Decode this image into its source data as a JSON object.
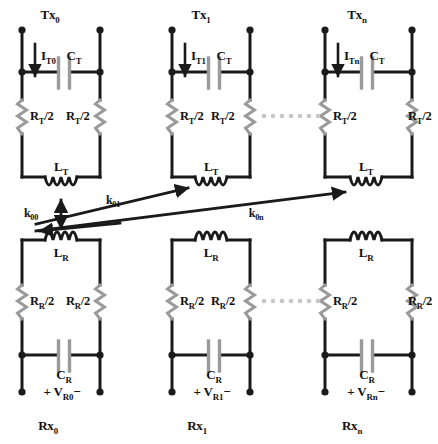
{
  "figure": {
    "type": "circuit-schematic",
    "background_color": "#ffffff",
    "line_color": "#1a1a1a",
    "component_color": "#9a9a9a",
    "dots_color": "#bdbdbd"
  },
  "transmitters": [
    {
      "id": "tx0",
      "title": "Tx",
      "title_sub": "0",
      "current_label": "I",
      "current_sub": "T0",
      "capacitor": "C",
      "capacitor_sub": "T",
      "resistor_left": "R",
      "resistor_left_sub": "T",
      "resistor_left_suffix": "/2",
      "resistor_right": "R",
      "resistor_right_sub": "T",
      "resistor_right_suffix": "/2",
      "inductor": "L",
      "inductor_sub": "T"
    },
    {
      "id": "tx1",
      "title": "Tx",
      "title_sub": "1",
      "current_label": "I",
      "current_sub": "T1",
      "capacitor": "C",
      "capacitor_sub": "T",
      "resistor_left": "R",
      "resistor_left_sub": "T",
      "resistor_left_suffix": "/2",
      "resistor_right": "R",
      "resistor_right_sub": "T",
      "resistor_right_suffix": "/2",
      "inductor": "L",
      "inductor_sub": "T"
    },
    {
      "id": "txn",
      "title": "Tx",
      "title_sub": "n",
      "current_label": "I",
      "current_sub": "Tn",
      "capacitor": "C",
      "capacitor_sub": "T",
      "resistor_left": "R",
      "resistor_left_sub": "T",
      "resistor_left_suffix": "/2",
      "resistor_right": "R",
      "resistor_right_sub": "T",
      "resistor_right_suffix": "/2",
      "inductor": "L",
      "inductor_sub": "T"
    }
  ],
  "receivers": [
    {
      "id": "rx0",
      "title": "Rx",
      "title_sub": "0",
      "inductor": "L",
      "inductor_sub": "R",
      "resistor_left": "R",
      "resistor_left_sub": "R",
      "resistor_left_suffix": "/2",
      "resistor_right": "R",
      "resistor_right_sub": "R",
      "resistor_right_suffix": "/2",
      "capacitor": "C",
      "capacitor_sub": "R",
      "voltage_plus": "+ V",
      "voltage_sub": "R0",
      "voltage_minus": "−"
    },
    {
      "id": "rx1",
      "title": "Rx",
      "title_sub": "1",
      "inductor": "L",
      "inductor_sub": "R",
      "resistor_left": "R",
      "resistor_left_sub": "R",
      "resistor_left_suffix": "/2",
      "resistor_right": "R",
      "resistor_right_sub": "R",
      "resistor_right_suffix": "/2",
      "capacitor": "C",
      "capacitor_sub": "R",
      "voltage_plus": "+ V",
      "voltage_sub": "R1",
      "voltage_minus": "−"
    },
    {
      "id": "rxn",
      "title": "Rx",
      "title_sub": "n",
      "inductor": "L",
      "inductor_sub": "R",
      "resistor_left": "R",
      "resistor_left_sub": "R",
      "resistor_left_suffix": "/2",
      "resistor_right": "R",
      "resistor_right_sub": "R",
      "resistor_right_suffix": "/2",
      "capacitor": "C",
      "capacitor_sub": "R",
      "voltage_plus": "+ V",
      "voltage_sub": "Rn",
      "voltage_minus": "−"
    }
  ],
  "couplings": [
    {
      "id": "k00",
      "label": "k",
      "sub": "00",
      "kind": "double-headed-vertical"
    },
    {
      "id": "k01",
      "label": "k",
      "sub": "01",
      "kind": "single-headed-diagonal"
    },
    {
      "id": "k0n",
      "label": "k",
      "sub": "0n",
      "kind": "single-headed-diagonal"
    }
  ],
  "ellipses": {
    "glyph": "· · · · · · · ·",
    "count": 3
  }
}
